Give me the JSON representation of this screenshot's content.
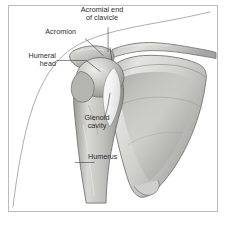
{
  "figure": {
    "view": "Anterior view of right shoulder",
    "style": "grayscale medical illustration",
    "frame_color": "#b9bcbe",
    "background_color": "#ffffff",
    "text_color": "#2b2b2b",
    "bone_fill_light": "#e9e9e7",
    "bone_fill_mid": "#c6c6c4",
    "bone_fill_dark": "#9b9b99",
    "outline_color": "#6f6f6d",
    "contour_color": "#8a8a88"
  },
  "labels": [
    {
      "id": "acromial-end-of-clavicle",
      "text": "Acromial end\nof clavicle",
      "line1": "Acromial end",
      "line2": "of clavicle",
      "align": "center"
    },
    {
      "id": "acromion",
      "text": "Acromion",
      "line1": "Acromion",
      "line2": "",
      "align": "right"
    },
    {
      "id": "humeral-head",
      "text": "Humeral\nhead",
      "line1": "Humeral",
      "line2": "head",
      "align": "right"
    },
    {
      "id": "glenoid-cavity",
      "text": "Glenoid\ncavity",
      "line1": "Glenoid",
      "line2": "cavity",
      "align": "center"
    },
    {
      "id": "humerus",
      "text": "Humerus",
      "line1": "Humerus",
      "line2": "",
      "align": "left"
    }
  ],
  "structures": [
    {
      "id": "clavicle",
      "name": "Clavicle"
    },
    {
      "id": "acromion",
      "name": "Acromion"
    },
    {
      "id": "scapula",
      "name": "Scapula"
    },
    {
      "id": "glenoid-cavity",
      "name": "Glenoid cavity"
    },
    {
      "id": "humeral-head",
      "name": "Humeral head"
    },
    {
      "id": "humerus",
      "name": "Humerus"
    },
    {
      "id": "body-contour",
      "name": "Body outline contour"
    }
  ]
}
